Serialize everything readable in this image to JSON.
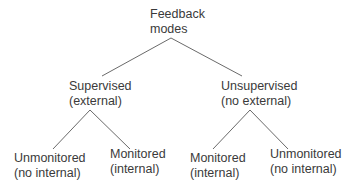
{
  "diagram": {
    "type": "tree",
    "root": {
      "line1": "Feedback",
      "line2": "modes"
    },
    "level1": [
      {
        "line1": "Supervised",
        "line2": "(external)"
      },
      {
        "line1": "Unsupervised",
        "line2": "(no external)"
      }
    ],
    "level2": [
      {
        "line1": "Unmonitored",
        "line2": "(no internal)"
      },
      {
        "line1": "Monitored",
        "line2": "(internal)"
      },
      {
        "line1": "Monitored",
        "line2": "(internal)"
      },
      {
        "line1": "Unmonitored",
        "line2": "(no internal)"
      }
    ],
    "colors": {
      "text": "#3a3a3a",
      "edge": "#6a6a6a",
      "background": "#ffffff"
    }
  }
}
